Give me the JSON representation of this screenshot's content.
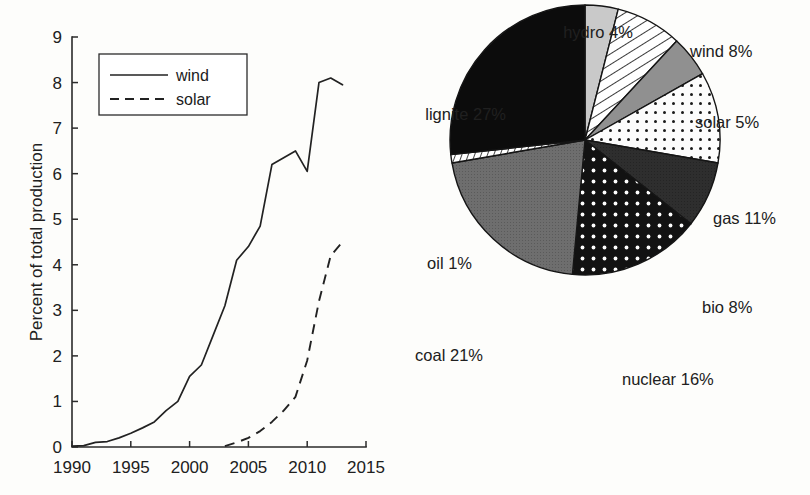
{
  "figure": {
    "background": "#fdfdfb",
    "ink": "#222222"
  },
  "chart_data": [
    {
      "type": "line",
      "id": "renewables-share-over-time",
      "title": "",
      "xlabel": "",
      "ylabel": "Percent of total production",
      "xlim": [
        1990,
        2015
      ],
      "ylim": [
        0,
        9
      ],
      "xticks": [
        1990,
        1995,
        2000,
        2005,
        2010,
        2015
      ],
      "xticklabels": [
        "1990",
        "1995",
        "2000",
        "2005",
        "2010",
        "2015"
      ],
      "yticks": [
        0,
        1,
        2,
        3,
        4,
        5,
        6,
        7,
        8,
        9
      ],
      "yticklabels": [
        "0",
        "1",
        "2",
        "3",
        "4",
        "5",
        "6",
        "7",
        "8",
        "9"
      ],
      "grid": false,
      "legend_position": "upper-left",
      "series": [
        {
          "name": "wind",
          "style": "solid",
          "x": [
            1990,
            1991,
            1992,
            1993,
            1994,
            1995,
            1996,
            1997,
            1998,
            1999,
            2000,
            2001,
            2002,
            2003,
            2004,
            2005,
            2006,
            2007,
            2008,
            2009,
            2010,
            2011,
            2012,
            2013
          ],
          "values": [
            0.02,
            0.03,
            0.1,
            0.12,
            0.2,
            0.3,
            0.42,
            0.55,
            0.8,
            1.0,
            1.55,
            1.8,
            2.45,
            3.1,
            4.1,
            4.4,
            4.85,
            6.2,
            6.35,
            6.5,
            6.05,
            8.0,
            8.1,
            7.95
          ]
        },
        {
          "name": "solar",
          "style": "dashed",
          "x": [
            2003,
            2004,
            2005,
            2006,
            2007,
            2008,
            2009,
            2010,
            2011,
            2012,
            2013
          ],
          "values": [
            0.02,
            0.1,
            0.2,
            0.35,
            0.55,
            0.8,
            1.1,
            1.9,
            3.2,
            4.2,
            4.5
          ]
        }
      ],
      "legend": [
        {
          "label": "wind",
          "style": "solid"
        },
        {
          "label": "solar",
          "style": "dashed"
        }
      ]
    },
    {
      "type": "pie",
      "id": "production-mix-by-source",
      "title": "",
      "start_angle_deg": -90,
      "direction": "clockwise",
      "labels": [
        "hydro",
        "wind",
        "solar",
        "gas",
        "bio",
        "nuclear",
        "coal",
        "oil",
        "lignite"
      ],
      "values": [
        4,
        8,
        5,
        11,
        8,
        16,
        21,
        1,
        27
      ],
      "label_texts": [
        "hydro 4%",
        "wind 8%",
        "solar 5%",
        "gas 11%",
        "bio 8%",
        "nuclear 16%",
        "coal 21%",
        "oil 1%",
        "lignite 27%"
      ],
      "slices": [
        {
          "name": "hydro",
          "value": 4,
          "label": "hydro 4%",
          "fill": "#c9c9c9",
          "pattern": "solid-light"
        },
        {
          "name": "wind",
          "value": 8,
          "label": "wind 8%",
          "fill": "#ffffff",
          "pattern": "diagonal-hatch"
        },
        {
          "name": "solar",
          "value": 5,
          "label": "solar 5%",
          "fill": "#909090",
          "pattern": "solid-mid"
        },
        {
          "name": "gas",
          "value": 11,
          "label": "gas 11%",
          "fill": "#fbfbfb",
          "pattern": "dots-dark-on-white"
        },
        {
          "name": "bio",
          "value": 8,
          "label": "bio 8%",
          "fill": "#2e2e2e",
          "pattern": "solid-dark"
        },
        {
          "name": "nuclear",
          "value": 16,
          "label": "nuclear 16%",
          "fill": "#121212",
          "pattern": "dots-white-on-black"
        },
        {
          "name": "coal",
          "value": 21,
          "label": "coal 21%",
          "fill": "#6e6e6e",
          "pattern": "solid-gray"
        },
        {
          "name": "oil",
          "value": 1,
          "label": "oil 1%",
          "fill": "#ffffff",
          "pattern": "fine-hatch"
        },
        {
          "name": "lignite",
          "value": 27,
          "label": "lignite 27%",
          "fill": "#0c0c0c",
          "pattern": "solid-black"
        }
      ]
    }
  ]
}
